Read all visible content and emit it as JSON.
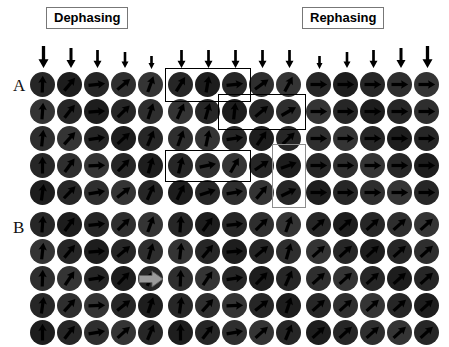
{
  "figure": {
    "background": "#ffffff",
    "disc_color": "#262626",
    "arrow_color": "#000000",
    "overlay_black": "#000000",
    "overlay_gray": "#8d8d8d",
    "block_arrow_color": "#9a9a9a"
  },
  "headers": [
    {
      "id": "dephasing",
      "label": "Dephasing"
    },
    {
      "id": "rephasing",
      "label": "Rephasing"
    }
  ],
  "row_labels": [
    {
      "id": "a",
      "label": "A"
    },
    {
      "id": "b",
      "label": "B"
    }
  ],
  "grid": {
    "rows": 5,
    "cols": 5,
    "cell": 27,
    "disc_diameter": 25
  },
  "panels": [
    {
      "id": "a-left",
      "row": "A",
      "x": 30,
      "y": 72,
      "stimulus": {
        "direction": "down",
        "sizes": [
          22,
          20,
          18,
          16,
          13
        ]
      },
      "spin_angles": [
        [
          -88,
          -50,
          -6,
          -40,
          -70
        ],
        [
          -86,
          -52,
          -4,
          -44,
          -72
        ],
        [
          -84,
          -48,
          -8,
          -42,
          -68
        ],
        [
          -90,
          -54,
          -2,
          -46,
          -74
        ],
        [
          -82,
          -46,
          -10,
          -38,
          -66
        ]
      ]
    },
    {
      "id": "a-middle",
      "row": "A",
      "x": 168,
      "y": 72,
      "stimulus": {
        "direction": "down",
        "sizes": [
          18,
          18,
          18,
          18,
          18
        ]
      },
      "spin_angles": [
        [
          -58,
          -80,
          -6,
          -36,
          -62
        ],
        [
          -66,
          -74,
          -84,
          -40,
          -30
        ],
        [
          -70,
          -78,
          -8,
          -56,
          -44
        ],
        [
          -76,
          -12,
          -60,
          -34,
          -20
        ],
        [
          -64,
          -18,
          -10,
          -50,
          -26
        ]
      ],
      "overlays": [
        {
          "name": "overlay-rect-top-left",
          "color": "black",
          "x": -3,
          "y": -4,
          "w": 84,
          "h": 32
        },
        {
          "name": "overlay-rect-middle-right",
          "color": "black",
          "x": 50,
          "y": 22,
          "w": 86,
          "h": 34
        },
        {
          "name": "overlay-rect-lower-left",
          "color": "black",
          "x": -3,
          "y": 78,
          "w": 84,
          "h": 30
        },
        {
          "name": "overlay-rect-right-vertical",
          "color": "gray",
          "x": 104,
          "y": 72,
          "w": 32,
          "h": 62
        }
      ]
    },
    {
      "id": "a-right",
      "row": "A",
      "x": 306,
      "y": 72,
      "stimulus": {
        "direction": "down",
        "sizes": [
          13,
          16,
          18,
          20,
          22
        ]
      },
      "spin_angles": [
        [
          0,
          0,
          0,
          0,
          0
        ],
        [
          0,
          0,
          0,
          0,
          0
        ],
        [
          0,
          0,
          0,
          0,
          0
        ],
        [
          0,
          0,
          0,
          0,
          0
        ],
        [
          0,
          0,
          0,
          0,
          0
        ]
      ]
    },
    {
      "id": "b-left",
      "row": "B",
      "x": 30,
      "y": 212,
      "stimulus": null,
      "spin_angles": [
        [
          -86,
          -54,
          -6,
          -44,
          -70
        ],
        [
          -84,
          -50,
          -4,
          -40,
          -74
        ],
        [
          -88,
          -56,
          -8,
          -46,
          -66
        ],
        [
          -82,
          -48,
          -2,
          -38,
          -72
        ],
        [
          -90,
          -52,
          -10,
          -42,
          -68
        ]
      ]
    },
    {
      "id": "b-middle",
      "row": "B",
      "x": 168,
      "y": 212,
      "stimulus": null,
      "block_arrow": {
        "name": "gray-block-arrow",
        "direction": "right"
      },
      "spin_angles": [
        [
          -86,
          -54,
          -6,
          -44,
          -70
        ],
        [
          -84,
          -50,
          -4,
          -40,
          -74
        ],
        [
          -88,
          -56,
          -8,
          -46,
          -66
        ],
        [
          -82,
          -48,
          -2,
          -38,
          -72
        ],
        [
          -90,
          -52,
          -10,
          -42,
          -68
        ]
      ]
    },
    {
      "id": "b-right",
      "row": "B",
      "x": 306,
      "y": 212,
      "stimulus": null,
      "spin_angles": [
        [
          -42,
          -42,
          -42,
          -42,
          -42
        ],
        [
          -42,
          -42,
          -42,
          -42,
          -42
        ],
        [
          -42,
          -42,
          -42,
          -42,
          -42
        ],
        [
          -42,
          -42,
          -42,
          -42,
          -42
        ],
        [
          -42,
          -42,
          -42,
          -42,
          -42
        ]
      ]
    }
  ]
}
